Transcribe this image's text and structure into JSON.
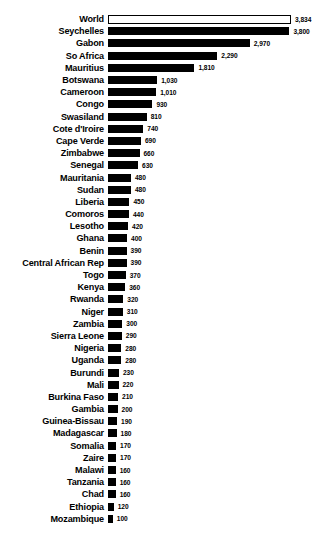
{
  "chart_data": {
    "type": "bar",
    "orientation": "horizontal",
    "title": "",
    "subtitle": "",
    "xlabel": "",
    "ylabel": "",
    "grid": false,
    "legend": null,
    "xlim": [
      0,
      3834
    ],
    "value_format": "comma-separated thousands",
    "highlight_note": "World bar drawn hollow (white fill, black outline); all country bars solid black",
    "categories": [
      "World",
      "Seychelles",
      "Gabon",
      "So Africa",
      "Mauritius",
      "Botswana",
      "Cameroon",
      "Congo",
      "Swasiland",
      "Cote d'Iroire",
      "Cape Verde",
      "Zimbabwe",
      "Senegal",
      "Mauritania",
      "Sudan",
      "Liberia",
      "Comoros",
      "Lesotho",
      "Ghana",
      "Benin",
      "Central African Rep",
      "Togo",
      "Kenya",
      "Rwanda",
      "Niger",
      "Zambia",
      "Sierra Leone",
      "Nigeria",
      "Uganda",
      "Burundi",
      "Mali",
      "Burkina Faso",
      "Gambia",
      "Guinea-Bissau",
      "Madagascar",
      "Somalia",
      "Zaire",
      "Malawi",
      "Tanzania",
      "Chad",
      "Ethiopia",
      "Mozambique"
    ],
    "values": [
      3834,
      3800,
      2970,
      2290,
      1810,
      1030,
      1010,
      930,
      810,
      740,
      690,
      660,
      630,
      480,
      480,
      450,
      440,
      420,
      400,
      390,
      390,
      370,
      360,
      320,
      310,
      300,
      290,
      280,
      280,
      230,
      220,
      210,
      200,
      190,
      180,
      170,
      170,
      160,
      160,
      160,
      120,
      100
    ],
    "value_labels": [
      "3,834",
      "3,800",
      "2,970",
      "2,290",
      "1,810",
      "1,030",
      "1,010",
      "930",
      "810",
      "740",
      "690",
      "660",
      "630",
      "480",
      "480",
      "450",
      "440",
      "420",
      "400",
      "390",
      "390",
      "370",
      "360",
      "320",
      "310",
      "300",
      "290",
      "280",
      "280",
      "230",
      "220",
      "210",
      "200",
      "190",
      "180",
      "170",
      "170",
      "160",
      "160",
      "160",
      "120",
      "100"
    ]
  }
}
